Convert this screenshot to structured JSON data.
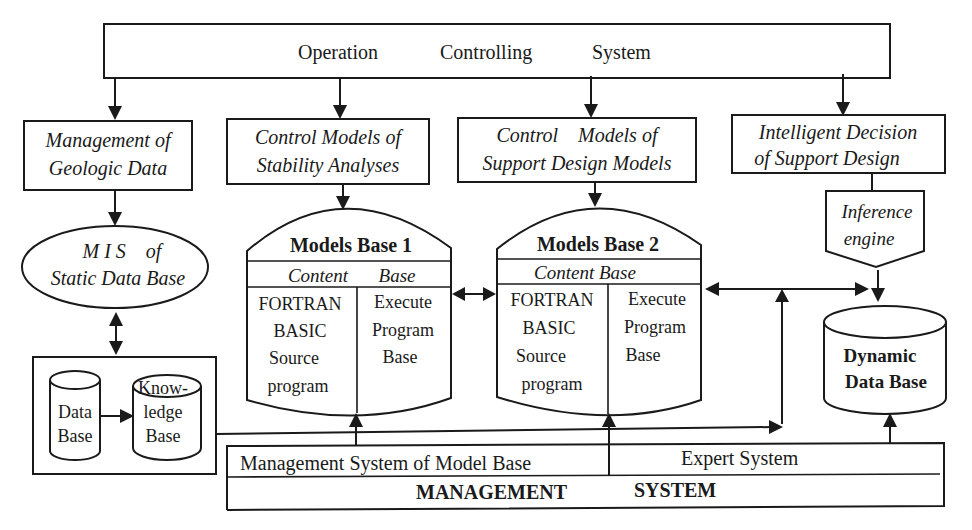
{
  "diagram": {
    "type": "system-architecture-flowchart",
    "top": {
      "words": [
        "Operation",
        "Controlling",
        "System"
      ]
    },
    "modules": [
      {
        "id": "geologic",
        "lines": [
          "Management of",
          "Geologic Data"
        ]
      },
      {
        "id": "stability",
        "lines": [
          "Control Models of",
          "Stability Analyses"
        ]
      },
      {
        "id": "support",
        "lines": [
          "Control    Models of",
          "Support Design Models"
        ]
      },
      {
        "id": "intelligent",
        "lines": [
          "Intelligent Decision",
          "of Support Design"
        ]
      }
    ],
    "mis": {
      "lines": [
        "M I S    of",
        "Static Data Base"
      ]
    },
    "static_box": {
      "data_base": [
        "Data",
        "Base"
      ],
      "knowledge_base": [
        "Know-",
        "ledge",
        "Base"
      ]
    },
    "models_base_1": {
      "title": "Models Base 1",
      "content_left": "Content",
      "content_right": "Base",
      "left_lines": [
        "FORTRAN",
        "BASIC",
        "Source",
        "program"
      ],
      "right_lines": [
        "Execute",
        "Program",
        "Base"
      ]
    },
    "models_base_2": {
      "title": "Models Base 2",
      "content": "Content Base",
      "left_lines": [
        "FORTRAN",
        "BASIC",
        "Source",
        "program"
      ],
      "right_lines": [
        "Execute",
        "Program",
        "Base"
      ]
    },
    "inference": {
      "lines": [
        "Inference",
        "engine"
      ]
    },
    "dynamic_db": {
      "lines": [
        "Dynamic",
        "Data Base"
      ]
    },
    "management": {
      "model_base_label": "Management System of Model Base",
      "expert_label": "Expert System",
      "title_words": [
        "MANAGEMENT",
        "SYSTEM"
      ]
    },
    "connections": [
      {
        "from": "Operation Controlling System",
        "to": "Management of Geologic Data"
      },
      {
        "from": "Operation Controlling System",
        "to": "Control Models of Stability Analyses"
      },
      {
        "from": "Operation Controlling System",
        "to": "Control Models of Support Design Models"
      },
      {
        "from": "Operation Controlling System",
        "to": "Intelligent Decision of Support Design"
      },
      {
        "from": "Management of Geologic Data",
        "to": "MIS of Static Data Base"
      },
      {
        "from": "MIS of Static Data Base",
        "to": "Data/Knowledge Base",
        "bidirectional": true
      },
      {
        "from": "Data Base",
        "to": "Knowledge Base"
      },
      {
        "from": "Control Models of Stability Analyses",
        "to": "Models Base 1"
      },
      {
        "from": "Control Models of Support Design Models",
        "to": "Models Base 2"
      },
      {
        "from": "Models Base 1",
        "to": "Models Base 2",
        "bidirectional": true
      },
      {
        "from": "Models Base 2",
        "to": "Dynamic Data Base",
        "bidirectional": true
      },
      {
        "from": "Intelligent Decision of Support Design",
        "to": "Inference engine"
      },
      {
        "from": "Inference engine",
        "to": "Dynamic Data Base"
      },
      {
        "from": "Management System of Model Base",
        "to": "Models Base 1"
      },
      {
        "from": "Management System of Model Base",
        "to": "Models Base 2"
      },
      {
        "from": "Knowledge Base",
        "to": "Expert System feedback line"
      },
      {
        "from": "Expert System",
        "to": "Dynamic Data Base"
      }
    ]
  }
}
